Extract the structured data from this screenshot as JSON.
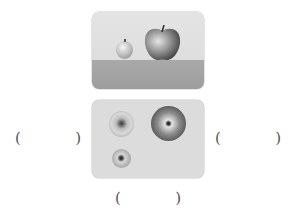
{
  "figure": {
    "top_view_panel": {
      "description": "side (front) view: small round fruit next to large apple on a table",
      "objects": [
        {
          "name": "small-fruit",
          "shape": "sphere"
        },
        {
          "name": "apple",
          "shape": "apple"
        }
      ],
      "colors": {
        "background": "#e0e0e0",
        "ground": "#a3a3a3"
      }
    },
    "bottom_view_panel": {
      "description": "top-down view of three round fruits",
      "objects": [
        {
          "name": "fruit-top-left-with-stem-end",
          "shape": "circle"
        },
        {
          "name": "large-dark-fruit",
          "shape": "circle"
        },
        {
          "name": "small-fruit-bottom",
          "shape": "circle"
        }
      ],
      "colors": {
        "background": "#dcdcdc"
      }
    }
  },
  "answer_blanks": [
    {
      "id": "left",
      "open": "(",
      "close": ")",
      "value": ""
    },
    {
      "id": "right",
      "open": "(",
      "close": ")",
      "value": ""
    },
    {
      "id": "bottom",
      "open": "(",
      "close": ")",
      "value": ""
    }
  ]
}
